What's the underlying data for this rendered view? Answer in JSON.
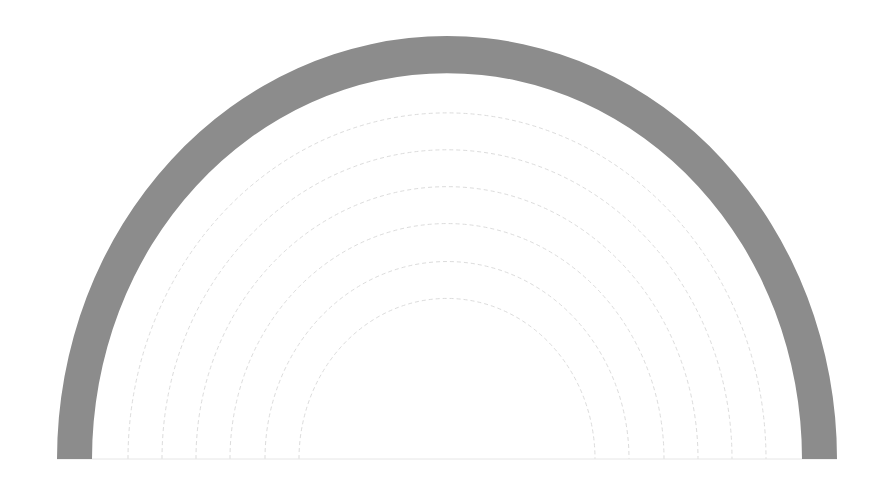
{
  "chart_data": {
    "type": "gauge",
    "title": "",
    "center": {
      "x": 447,
      "y": 459
    },
    "outer_band": {
      "rx_outer": 390,
      "ry_outer": 423,
      "rx_inner": 355,
      "ry_inner": 386,
      "color": "#8c8c8c"
    },
    "grid_arcs": {
      "rx": [
        319,
        285,
        251,
        217,
        182,
        148
      ],
      "ratio": 1.085,
      "color": "#dcdcdc",
      "dash": "4 3"
    },
    "baseline": {
      "y": 459,
      "color": "#e6e6e6"
    },
    "labels": [],
    "grid": true,
    "legend": null
  }
}
